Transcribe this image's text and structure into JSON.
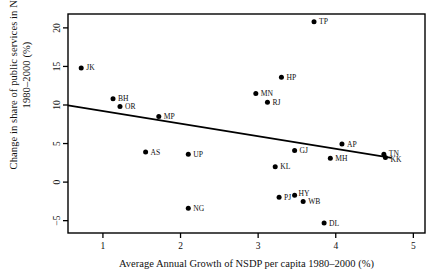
{
  "chart_data": {
    "type": "scatter",
    "title": "",
    "xlabel": "Average Annual Growth of NSDP per capita 1980–2000 (%)",
    "ylabel_line1": "Change in share of public services in NSDP",
    "ylabel_line2": "1980–2000 (%)",
    "xlim": [
      0.55,
      5.15
    ],
    "ylim": [
      -6.6,
      21.8
    ],
    "xticks": [
      1,
      2,
      3,
      4,
      5
    ],
    "xtick_labels": [
      "1",
      "2",
      "3",
      "4",
      "5"
    ],
    "yticks": [
      -5,
      0,
      5,
      10,
      15,
      20
    ],
    "ytick_labels": [
      "−5",
      "0",
      "5",
      "10",
      "15",
      "20"
    ],
    "grid": false,
    "legend": "none",
    "marker_color": "#000000",
    "line_color": "#000000",
    "frame_color": "#000000",
    "points": [
      {
        "label": "JK",
        "x": 0.72,
        "y": 14.8,
        "label_dx": 5,
        "label_dy": 2.4
      },
      {
        "label": "BH",
        "x": 1.13,
        "y": 10.8,
        "label_dx": 5,
        "label_dy": 2.4
      },
      {
        "label": "OR",
        "x": 1.22,
        "y": 9.8,
        "label_dx": 5,
        "label_dy": 2.6
      },
      {
        "label": "MP",
        "x": 1.72,
        "y": 8.5,
        "label_dx": 5,
        "label_dy": 2.8
      },
      {
        "label": "AS",
        "x": 1.55,
        "y": 3.9,
        "label_dx": 5,
        "label_dy": 2.6
      },
      {
        "label": "UP",
        "x": 2.1,
        "y": 3.6,
        "label_dx": 5,
        "label_dy": 2.6
      },
      {
        "label": "NG",
        "x": 2.1,
        "y": -3.4,
        "label_dx": 5,
        "label_dy": 2.6
      },
      {
        "label": "MN",
        "x": 2.97,
        "y": 11.5,
        "label_dx": 5,
        "label_dy": 2.4
      },
      {
        "label": "RJ",
        "x": 3.12,
        "y": 10.35,
        "label_dx": 5,
        "label_dy": 2.6
      },
      {
        "label": "HP",
        "x": 3.3,
        "y": 13.6,
        "label_dx": 5,
        "label_dy": 2.6
      },
      {
        "label": "TP",
        "x": 3.72,
        "y": 20.8,
        "label_dx": 5,
        "label_dy": 2.4
      },
      {
        "label": "GJ",
        "x": 3.47,
        "y": 4.1,
        "label_dx": 5,
        "label_dy": 2.8
      },
      {
        "label": "KL",
        "x": 3.22,
        "y": 2.0,
        "label_dx": 5,
        "label_dy": 2.8
      },
      {
        "label": "PJ",
        "x": 3.27,
        "y": -1.95,
        "label_dx": 5,
        "label_dy": 2.6
      },
      {
        "label": "HY",
        "x": 3.47,
        "y": -1.7,
        "label_dx": 4,
        "label_dy": 1.2
      },
      {
        "label": "WB",
        "x": 3.58,
        "y": -2.5,
        "label_dx": 5,
        "label_dy": 2.8
      },
      {
        "label": "MH",
        "x": 3.93,
        "y": 3.1,
        "label_dx": 5,
        "label_dy": 2.8
      },
      {
        "label": "AP",
        "x": 4.08,
        "y": 4.95,
        "label_dx": 5,
        "label_dy": 2.6
      },
      {
        "label": "DL",
        "x": 3.85,
        "y": -5.3,
        "label_dx": 5,
        "label_dy": 2.8
      },
      {
        "label": "TN",
        "x": 4.62,
        "y": 3.6,
        "label_dx": 5,
        "label_dy": 1.6
      },
      {
        "label": "KK",
        "x": 4.64,
        "y": 3.2,
        "label_dx": 5,
        "label_dy": 4.6
      }
    ],
    "trend_line": {
      "name": "fitted regression line",
      "x_start": 0.55,
      "y_start": 9.95,
      "x_end": 4.72,
      "y_end": 3.15
    }
  }
}
